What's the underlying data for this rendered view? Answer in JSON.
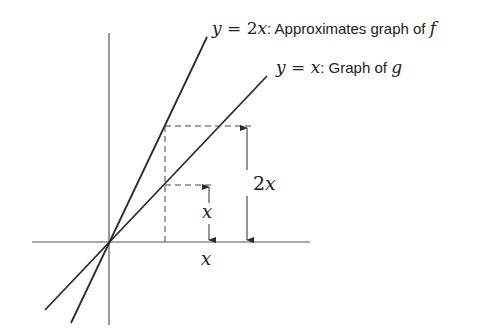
{
  "diagram": {
    "lines": [
      {
        "id": "f-approx",
        "equation": "y = 2x",
        "description": "Approximates graph of f"
      },
      {
        "id": "g",
        "equation": "y = x",
        "description": "Graph of g"
      }
    ],
    "labels": {
      "line_2x_eq_y": "y",
      "line_2x_eq_eq": " = ",
      "line_2x_eq_rhs": "2x",
      "line_2x_colon": ":",
      "line_2x_text": " Approximates graph of ",
      "line_2x_fn": "f",
      "line_x_eq_y": "y",
      "line_x_eq_eq": " = ",
      "line_x_eq_rhs": "x",
      "line_x_colon": ":",
      "line_x_text": " Graph of ",
      "line_x_fn": "g",
      "rise_x": "x",
      "rise_2x": "2x",
      "run_x": "x"
    },
    "colors": {
      "stroke": "#2b2b2b",
      "axis": "#555555",
      "text": "#222222"
    }
  }
}
